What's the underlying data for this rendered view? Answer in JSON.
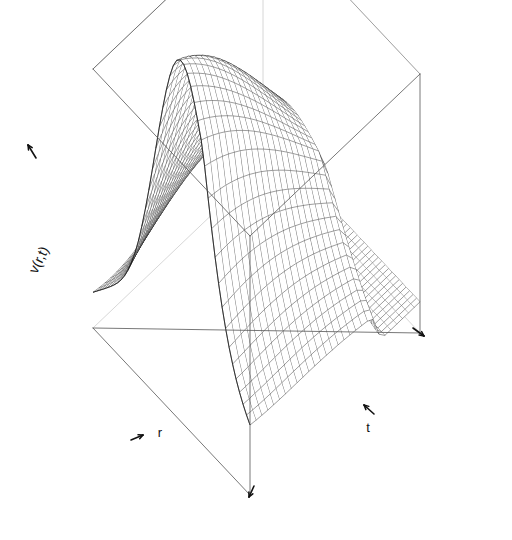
{
  "figure": {
    "kind": "3d-wireframe-surface",
    "renderer": "persp",
    "background": "#ffffff",
    "line_color": "#1a1a1a",
    "box_color": "#555555",
    "hidden_edge_color": "#bbbbbb",
    "width": 512,
    "height": 540
  },
  "axes": {
    "z": {
      "label": "v(r,t)",
      "name": "vertical-axis"
    },
    "x": {
      "label": "r",
      "name": "depth-axis"
    },
    "y": {
      "label": "t",
      "name": "time-axis"
    }
  },
  "caption": {
    "text": ""
  },
  "chart_data": {
    "type": "surface",
    "title": "",
    "xlabel": "r",
    "ylabel": "t",
    "zlabel": "v(r,t)",
    "grid": true,
    "legend": false,
    "projection": {
      "theta": -35,
      "phi": 22,
      "box": true,
      "ticks": "arrows"
    },
    "box_corners": {
      "top_back": [
        265,
        33
      ],
      "top_left": [
        33,
        128
      ],
      "top_right": [
        492,
        133
      ],
      "top_front": [
        250,
        236
      ],
      "bottom_left": [
        93,
        328
      ],
      "bottom_right": [
        420,
        333
      ],
      "bottom_front": [
        250,
        495
      ]
    },
    "xlim": [
      0,
      1
    ],
    "ylim": [
      0,
      1
    ],
    "zlim": [
      0,
      1
    ],
    "nx": 46,
    "ny": 30,
    "surface_model": {
      "form": "ridge-plus-plateau",
      "crest_height": 1.0,
      "plateau_height": 0.12,
      "cliff_position_t": 0.72,
      "crest_position_r": 0.46,
      "crest_width": 0.22,
      "decay_rate": 1.15
    }
  }
}
